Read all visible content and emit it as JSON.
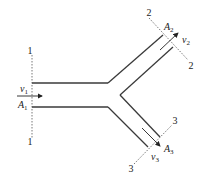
{
  "diagram": {
    "type": "pipe-branch-flow",
    "sections": [
      {
        "id": "1",
        "label_top": "1",
        "label_bottom": "1",
        "area": "A",
        "area_sub": "1",
        "velocity": "v",
        "velocity_sub": "1"
      },
      {
        "id": "2",
        "label_start": "2",
        "label_end": "2",
        "area": "A",
        "area_sub": "2",
        "velocity": "v",
        "velocity_sub": "2"
      },
      {
        "id": "3",
        "label_start": "3",
        "label_end": "3",
        "area": "A",
        "area_sub": "3",
        "velocity": "v",
        "velocity_sub": "3"
      }
    ],
    "colors": {
      "line": "#3a3a3a",
      "background": "#ffffff"
    }
  }
}
